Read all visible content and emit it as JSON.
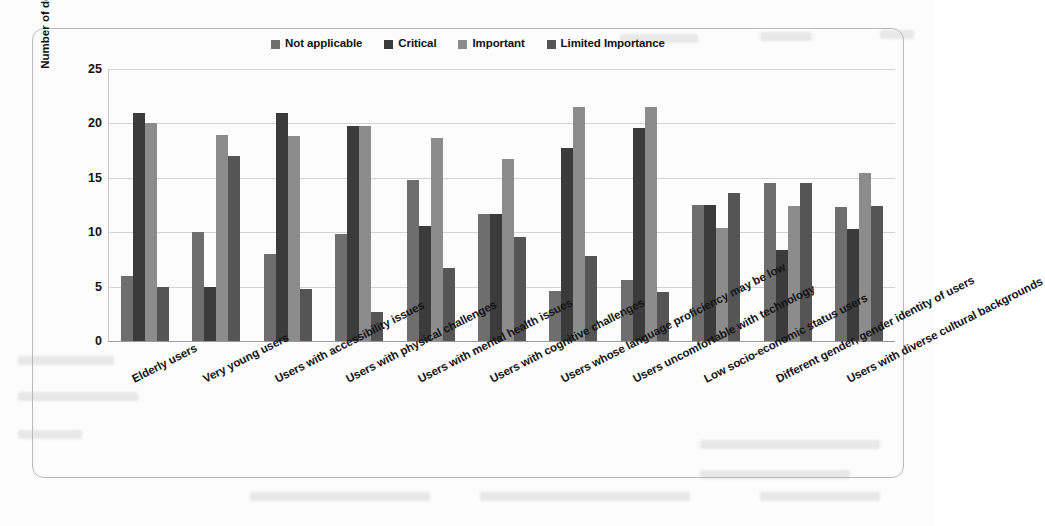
{
  "chart_data": {
    "type": "bar",
    "title": "",
    "xlabel": "",
    "ylabel": "Number of developers",
    "ylim": [
      0,
      25
    ],
    "yticks": [
      0,
      5,
      10,
      15,
      20,
      25
    ],
    "grid": true,
    "legend_position": "top-center",
    "categories": [
      "Elderly users",
      "Very young users",
      "Users with accessibility issues",
      "Users with physical challenges",
      "Users with mental health issues",
      "Users with cognitive challenges",
      "Users whose language proficiency may be low",
      "Users uncomfortable with technology",
      "Low socio-economic status users",
      "Different gender, gender identity of users",
      "Users with diverse cultural backgrounds"
    ],
    "series": [
      {
        "name": "Not applicable",
        "color": "#6e6e6e",
        "values": [
          6.0,
          10.0,
          8.0,
          9.8,
          14.8,
          11.7,
          4.6,
          5.6,
          12.5,
          14.5,
          12.3
        ]
      },
      {
        "name": "Critical",
        "color": "#3b3b3b",
        "values": [
          21.0,
          5.0,
          21.0,
          19.8,
          10.6,
          11.7,
          17.7,
          19.6,
          12.5,
          8.4,
          10.3
        ]
      },
      {
        "name": "Important",
        "color": "#8c8c8c",
        "values": [
          20.0,
          18.9,
          18.8,
          19.8,
          18.7,
          16.7,
          21.5,
          21.5,
          10.4,
          12.4,
          15.4
        ]
      },
      {
        "name": "Limited Importance",
        "color": "#555555",
        "values": [
          5.0,
          17.0,
          4.8,
          2.7,
          6.7,
          9.6,
          7.8,
          4.5,
          13.6,
          14.5,
          12.4
        ]
      }
    ]
  },
  "figure": {
    "border_color": "#b9b9b9",
    "background": "#ffffff"
  }
}
